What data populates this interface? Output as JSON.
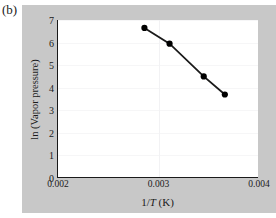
{
  "figure": {
    "subfigure_label": "(b)",
    "panel_color": "#c8c8c8",
    "plot_background": "#ffffff",
    "axis_color": "#1a1a1a"
  },
  "chart_data": {
    "type": "line",
    "title": "",
    "xlabel": "1/T (K)",
    "ylabel": "ln (Vapor pressure)",
    "xlim": [
      0.002,
      0.004
    ],
    "ylim": [
      0,
      7
    ],
    "xticks": [
      0.002,
      0.003,
      0.004
    ],
    "xtick_labels": [
      "0.002",
      "0.003",
      "0.004"
    ],
    "yticks": [
      0,
      1,
      2,
      3,
      4,
      5,
      6,
      7
    ],
    "ytick_labels": [
      "0",
      "1",
      "2",
      "3",
      "4",
      "5",
      "6",
      "7"
    ],
    "grid": true,
    "legend": false,
    "marker": "filled-circle",
    "marker_color": "#000000",
    "line_color": "#1a1a1a",
    "series": [
      {
        "name": "ln(Vapor pressure) vs 1/T",
        "x": [
          0.00286,
          0.00311,
          0.00345,
          0.00366
        ],
        "y": [
          6.65,
          5.95,
          4.5,
          3.7
        ]
      }
    ]
  }
}
